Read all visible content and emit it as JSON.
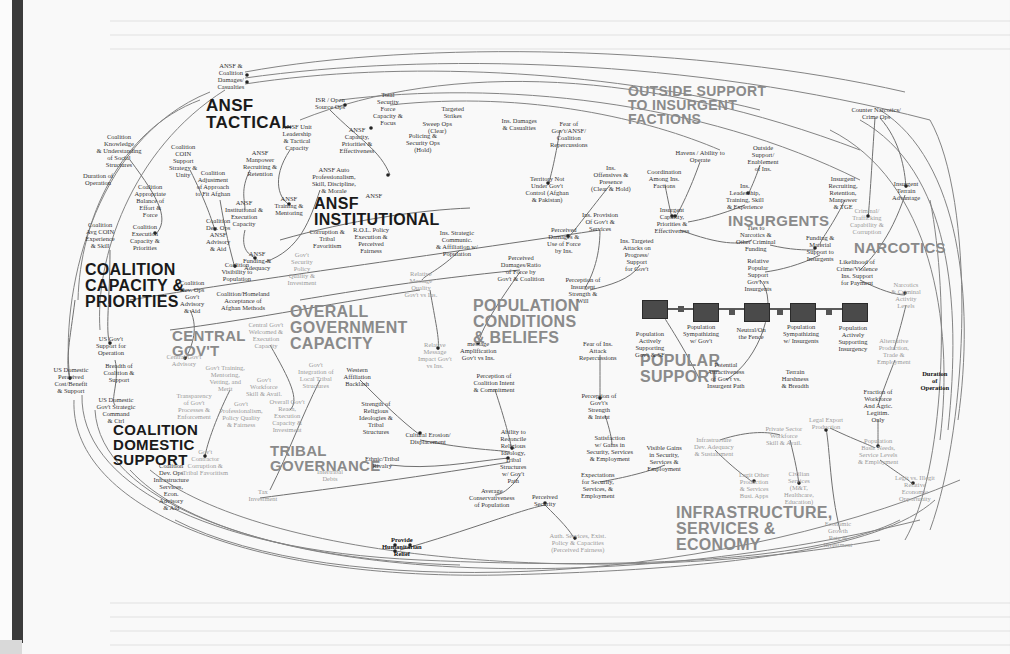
{
  "diagram": {
    "type": "causal-loop / system dynamics map",
    "clusters": [
      {
        "id": "ansf-tactical",
        "label": "ANSF\nTACTICAL",
        "x": 206,
        "y": 97,
        "size": 17,
        "tone": "dark"
      },
      {
        "id": "ansf-institutional",
        "label": "ANSF\nINSTITUTIONAL",
        "x": 314,
        "y": 196,
        "size": 16,
        "tone": "dark"
      },
      {
        "id": "coalition-capacity",
        "label": "COALITION\nCAPACITY &\nPRIORITIES",
        "x": 85,
        "y": 262,
        "size": 16,
        "tone": "dark"
      },
      {
        "id": "coalition-domestic",
        "label": "COALITION\nDOMESTIC\nSUPPORT",
        "x": 113,
        "y": 422,
        "size": 15,
        "tone": "dark"
      },
      {
        "id": "central-govt",
        "label": "CENTRAL\nGOV'T",
        "x": 172,
        "y": 328,
        "size": 15,
        "tone": "grey"
      },
      {
        "id": "overall-government",
        "label": "OVERALL\nGOVERNMENT\nCAPACITY",
        "x": 290,
        "y": 304,
        "size": 16,
        "tone": "grey"
      },
      {
        "id": "tribal-governance",
        "label": "TRIBAL\nGOVERNANCE",
        "x": 270,
        "y": 443,
        "size": 15,
        "tone": "grey"
      },
      {
        "id": "population",
        "label": "POPULATION\nCONDITIONS\n& BELIEFS",
        "x": 473,
        "y": 298,
        "size": 16,
        "tone": "grey"
      },
      {
        "id": "outside-support",
        "label": "OUTSIDE SUPPORT\nTO INSURGENT\nFACTIONS",
        "x": 628,
        "y": 84,
        "size": 14,
        "tone": "grey"
      },
      {
        "id": "insurgents",
        "label": "INSURGENTS",
        "x": 728,
        "y": 213,
        "size": 15,
        "tone": "grey"
      },
      {
        "id": "narcotics",
        "label": "NARCOTICS",
        "x": 854,
        "y": 240,
        "size": 15,
        "tone": "grey"
      },
      {
        "id": "popular-support",
        "label": "POPULAR\nSUPPORT",
        "x": 640,
        "y": 353,
        "size": 16,
        "tone": "grey"
      },
      {
        "id": "infrastructure",
        "label": "INFRASTRUCTURE,\nSERVICES &\nECONOMY",
        "x": 676,
        "y": 505,
        "size": 16,
        "tone": "grey"
      }
    ],
    "nodes": [
      {
        "label": "ANSF &\nCoalition\nDamages/\nCasualties",
        "x": 231,
        "y": 76,
        "tone": "normal"
      },
      {
        "label": "ISR / Open\nSource Ops",
        "x": 330,
        "y": 103,
        "tone": "normal"
      },
      {
        "label": "Total\nSecurity\nForce\nCapacity &\nFocus",
        "x": 388,
        "y": 108,
        "tone": "normal"
      },
      {
        "label": "Targeted\nStrikes",
        "x": 453,
        "y": 112,
        "tone": "normal"
      },
      {
        "label": "Sweep Ops\n(Clear)",
        "x": 437,
        "y": 127,
        "tone": "normal"
      },
      {
        "label": "Policing &\nSecurity Ops\n(Hold)",
        "x": 423,
        "y": 142,
        "tone": "normal"
      },
      {
        "label": "ANSF Unit\nLeadership\n& Tactical\nCapacity",
        "x": 297,
        "y": 137,
        "tone": "normal"
      },
      {
        "label": "ANSF\nCapacity,\nPriorities &\nEffectiveness",
        "x": 357,
        "y": 140,
        "tone": "normal"
      },
      {
        "label": "ANSF\nManpower\nRecruiting &\nRetention",
        "x": 260,
        "y": 163,
        "tone": "normal"
      },
      {
        "label": "ANSF Auto\nProfessionalism,\nSkill, Discipline,\n& Morale",
        "x": 334,
        "y": 180,
        "tone": "normal"
      },
      {
        "label": "ANSF\nTraining &\nMentoring",
        "x": 289,
        "y": 205,
        "tone": "normal"
      },
      {
        "label": "ANSF\nInstitutional &\nExecution\nCapacity",
        "x": 244,
        "y": 213,
        "tone": "normal"
      },
      {
        "label": "Corruption &\nTribal\nFavoritism",
        "x": 327,
        "y": 238,
        "tone": "normal"
      },
      {
        "label": "R.O.L. Policy\nExecution &\nPerceived\nFairness",
        "x": 371,
        "y": 240,
        "tone": "normal"
      },
      {
        "label": "ANSF\nFunding &\nAdequacy",
        "x": 257,
        "y": 260,
        "tone": "normal"
      },
      {
        "label": "Gov't\nSecurity\nPolicy\nQuality &\nInvestment",
        "x": 302,
        "y": 268,
        "tone": "grey"
      },
      {
        "label": "Coalition\nKnowledge\n& Understanding\nof Social\nStructures",
        "x": 119,
        "y": 150,
        "tone": "normal"
      },
      {
        "label": "Coalition\nCOIN\nSupport\nStrategy &\nUnity",
        "x": 183,
        "y": 160,
        "tone": "normal"
      },
      {
        "label": "Duration of\nOperation",
        "x": 98,
        "y": 179,
        "tone": "normal"
      },
      {
        "label": "Coalition\nAppropriate\nBalance of\nEffort &\nForce",
        "x": 150,
        "y": 200,
        "tone": "normal"
      },
      {
        "label": "Coalition\nAdjustment\nof Approach\nto Fit Afghan",
        "x": 213,
        "y": 183,
        "tone": "normal"
      },
      {
        "label": "Coalition\nAvg COIN\nExperience\n& Skill",
        "x": 100,
        "y": 235,
        "tone": "normal"
      },
      {
        "label": "Coalition\nExecution\nCapacity &\nPriorities",
        "x": 145,
        "y": 237,
        "tone": "normal"
      },
      {
        "label": "Coalition\nDev. Ops\nANSF\nAdvisory\n& Aid",
        "x": 218,
        "y": 234,
        "tone": "normal"
      },
      {
        "label": "Coalition\nVisibility to\nPopulation",
        "x": 237,
        "y": 271,
        "tone": "normal"
      },
      {
        "label": "Coalition\nDev. Ops\nGov't\nAdvisory\n& Aid",
        "x": 192,
        "y": 296,
        "tone": "normal"
      },
      {
        "label": "Coalition/Homeland\nAcceptance of\nAfghan Methods",
        "x": 243,
        "y": 300,
        "tone": "normal"
      },
      {
        "label": "US Gov't\nSupport for\nOperation",
        "x": 111,
        "y": 345,
        "tone": "normal"
      },
      {
        "label": "Breadth of\nCoalition &\nSupport",
        "x": 119,
        "y": 372,
        "tone": "normal"
      },
      {
        "label": "US Domestic\nPerceived\nCost/Benefit\n& Support",
        "x": 71,
        "y": 380,
        "tone": "normal"
      },
      {
        "label": "US Domestic\nGov't Strategic\nCommand\n& Ctrl",
        "x": 116,
        "y": 410,
        "tone": "normal"
      },
      {
        "label": "Coalition\nDev. Ops\nInfrastructure\nServices,\nEcon.\nAdvisory\n& Aid",
        "x": 171,
        "y": 486,
        "tone": "normal"
      },
      {
        "label": "Central Gov't\nAdvisory",
        "x": 184,
        "y": 360,
        "tone": "grey"
      },
      {
        "label": "Central Gov't\nWelcomed &\nExecution\nCapacity",
        "x": 266,
        "y": 335,
        "tone": "grey"
      },
      {
        "label": "Gov't Training,\nMentoring,\nVetting, and\nMerit",
        "x": 225,
        "y": 378,
        "tone": "grey"
      },
      {
        "label": "Gov't\nWorkforce\nSkill & Avail.",
        "x": 264,
        "y": 386,
        "tone": "grey"
      },
      {
        "label": "Transparency\nof Gov't\nProcesses &\nEnforcement",
        "x": 194,
        "y": 406,
        "tone": "grey"
      },
      {
        "label": "Gov't\nProfessionalism,\nPolicy Quality\n& Fairness",
        "x": 241,
        "y": 414,
        "tone": "grey"
      },
      {
        "label": "Overall Gov't\nReach,\nExecution\nCapacity &\nInvestment",
        "x": 287,
        "y": 415,
        "tone": "grey"
      },
      {
        "label": "Gov't\nIntegration of\nLocal Tribal\nStructures",
        "x": 316,
        "y": 375,
        "tone": "grey"
      },
      {
        "label": "Gov't\nContractor\nCorruption &\nTribal Favoritism",
        "x": 205,
        "y": 462,
        "tone": "grey"
      },
      {
        "label": "Tax\nInvestment",
        "x": 263,
        "y": 495,
        "tone": "grey"
      },
      {
        "label": "Western\nAffiliation\nBacklash",
        "x": 357,
        "y": 376,
        "tone": "normal"
      },
      {
        "label": "Strength of\nReligious\nIdeologies &\nTribal\nStructures",
        "x": 376,
        "y": 417,
        "tone": "normal"
      },
      {
        "label": "Cultural Erosion/\nDisplacement",
        "x": 428,
        "y": 438,
        "tone": "normal"
      },
      {
        "label": "Ethnic/Tribal\nRivalry",
        "x": 382,
        "y": 462,
        "tone": "normal"
      },
      {
        "label": "Intertribal\nDebts",
        "x": 330,
        "y": 475,
        "tone": "grey"
      },
      {
        "label": "Relative\nMessage\nQuality\nGov't vs Ins.",
        "x": 421,
        "y": 284,
        "tone": "grey"
      },
      {
        "label": "Relative\nMessage\nImpact Gov't\nvs Ins.",
        "x": 435,
        "y": 355,
        "tone": "grey"
      },
      {
        "label": "message\nAmplification\nGov't vs Ins.",
        "x": 478,
        "y": 350,
        "tone": "normal"
      },
      {
        "label": "Perception of\nCoalition Intent\n& Commitment",
        "x": 494,
        "y": 382,
        "tone": "normal"
      },
      {
        "label": "Ins. Strategic\nCommunic.\n& Affiliation w/\nPopulation",
        "x": 457,
        "y": 243,
        "tone": "normal"
      },
      {
        "label": "Perceived\nDamages/Ratio\nof Force by\nGov't & Coalition",
        "x": 521,
        "y": 268,
        "tone": "normal"
      },
      {
        "label": "Perceived\nDamages &\nUse of Force\nby Ins.",
        "x": 564,
        "y": 240,
        "tone": "normal"
      },
      {
        "label": "Perception of\nInsurgent\nStrength &\nWill",
        "x": 583,
        "y": 290,
        "tone": "normal"
      },
      {
        "label": "Ins. Provision\nOf Gov't &\nServices",
        "x": 600,
        "y": 221,
        "tone": "normal"
      },
      {
        "label": "Ins. Targeted\nAttacks on\nProgress/\nSupport\nfor Gov't",
        "x": 637,
        "y": 254,
        "tone": "normal"
      },
      {
        "label": "Ins. Damages\n& Casualties",
        "x": 519,
        "y": 124,
        "tone": "normal"
      },
      {
        "label": "Fear of\nGov't/ANSF/\nCoalition\nRepercussions",
        "x": 569,
        "y": 134,
        "tone": "normal"
      },
      {
        "label": "Territory Not\nUnder Gov't\nControl (Afghan\n& Pakistan)",
        "x": 547,
        "y": 189,
        "tone": "normal"
      },
      {
        "label": "Ins.\nOffensives &\nPresence\n(Clear & Hold)",
        "x": 611,
        "y": 178,
        "tone": "normal"
      },
      {
        "label": "Fear of Ins.\nAttack\nRepercussions",
        "x": 598,
        "y": 350,
        "tone": "normal"
      },
      {
        "label": "Perception of\nGov't's\nStrength\n& Intent",
        "x": 599,
        "y": 406,
        "tone": "normal"
      },
      {
        "label": "Ability to\nReconcile\nReligious\nIdeology,\nTribal\nStructures\nw/ Gov't\nPath",
        "x": 513,
        "y": 456,
        "tone": "normal"
      },
      {
        "label": "Average\nConservativeness\nof Population",
        "x": 492,
        "y": 497,
        "tone": "normal"
      },
      {
        "label": "Perceived\nSecurity",
        "x": 545,
        "y": 500,
        "tone": "normal"
      },
      {
        "label": "Satisfaction\nw/ Gains in\nSecurity, Services\n& Employment",
        "x": 610,
        "y": 448,
        "tone": "normal"
      },
      {
        "label": "Visible Gains\nin Security,\nServices &\nEmployment",
        "x": 664,
        "y": 458,
        "tone": "normal"
      },
      {
        "label": "Expectations\nfor Security,\nServices, &\nEmployment",
        "x": 598,
        "y": 485,
        "tone": "normal"
      },
      {
        "label": "Auth. Services, Exist.\nPolicy & Capacities\n(Perceived Fairness)",
        "x": 578,
        "y": 542,
        "tone": "grey"
      },
      {
        "label": "Provide\nHumanitarian\nRelief",
        "x": 402,
        "y": 546,
        "tone": "bold"
      },
      {
        "label": "Havens / Ability to\nOperate",
        "x": 700,
        "y": 156,
        "tone": "normal"
      },
      {
        "label": "Coordination\nAmong Ins.\nFactions",
        "x": 664,
        "y": 178,
        "tone": "normal"
      },
      {
        "label": "Outside\nSupport/\nEnablement\nof Ins.",
        "x": 763,
        "y": 158,
        "tone": "normal"
      },
      {
        "label": "Ins.\nLeadership,\nTraining, Skill\n& Experience",
        "x": 745,
        "y": 196,
        "tone": "normal"
      },
      {
        "label": "Insurgent\nCapacity,\nPriorities &\nEffectiveness",
        "x": 672,
        "y": 220,
        "tone": "normal"
      },
      {
        "label": "Insurgent\nRecruiting,\nRetention,\nManpower\n& TGE",
        "x": 843,
        "y": 192,
        "tone": "normal"
      },
      {
        "label": "Ties to\nNarcotics &\nOther Criminal\nFunding",
        "x": 756,
        "y": 238,
        "tone": "normal"
      },
      {
        "label": "Funding &\nMaterial\nSupport to\nInsurgents",
        "x": 820,
        "y": 248,
        "tone": "normal"
      },
      {
        "label": "Relative\nPopular\nSupport\nGov't vs\nInsurgents",
        "x": 758,
        "y": 274,
        "tone": "normal"
      },
      {
        "label": "Likelihood of\nCrime/Violence\nIns. Support\nfor Payment",
        "x": 857,
        "y": 272,
        "tone": "normal"
      },
      {
        "label": "Counter Narcotics/\nCrime Ops",
        "x": 876,
        "y": 113,
        "tone": "normal"
      },
      {
        "label": "Criminal/\nTrafficking\nCapability &\nCorruption",
        "x": 867,
        "y": 221,
        "tone": "grey"
      },
      {
        "label": "Insurgent\nTerrain\nAdvantage",
        "x": 906,
        "y": 190,
        "tone": "normal"
      },
      {
        "label": "Narcotics\n& Criminal\nActivity\nLevels",
        "x": 906,
        "y": 295,
        "tone": "grey"
      },
      {
        "label": "Alternative\nProduction,\nTrade &\nEmployment",
        "x": 894,
        "y": 351,
        "tone": "grey"
      },
      {
        "label": "Duration\nof\nOperation",
        "x": 935,
        "y": 380,
        "tone": "bold"
      },
      {
        "label": "Fraction of\nWorkforce\nAnd Agric.\nLegitim.\nOnly",
        "x": 878,
        "y": 405,
        "tone": "normal"
      },
      {
        "label": "Population\nActively\nSupporting\nGov't & SF",
        "x": 650,
        "y": 344,
        "tone": "normal"
      },
      {
        "label": "Population\nSympathizing\nw/ Gov't",
        "x": 701,
        "y": 333,
        "tone": "normal"
      },
      {
        "label": "Neutral/On\nthe Fence",
        "x": 751,
        "y": 333,
        "tone": "normal"
      },
      {
        "label": "Population\nSympathizing\nw/ Insurgents",
        "x": 801,
        "y": 333,
        "tone": "normal"
      },
      {
        "label": "Population\nActively\nSupporting\nInsurgency",
        "x": 853,
        "y": 338,
        "tone": "normal"
      },
      {
        "label": "Potential\nAttractiveness\nof Gov't vs.\nInsurgent Path",
        "x": 726,
        "y": 375,
        "tone": "normal"
      },
      {
        "label": "Terrain\nHarshness\n& Breadth",
        "x": 795,
        "y": 378,
        "tone": "normal"
      },
      {
        "label": "Infrastructure\nDev. Adequacy\n& Sustainment",
        "x": 714,
        "y": 446,
        "tone": "grey"
      },
      {
        "label": "Private Sector\nWorkforce\nSkill & Avail.",
        "x": 784,
        "y": 435,
        "tone": "grey"
      },
      {
        "label": "Legal Export\nProduction",
        "x": 826,
        "y": 423,
        "tone": "grey"
      },
      {
        "label": "Legit Other\nProduction\n& Services\nBusi. Apps",
        "x": 754,
        "y": 485,
        "tone": "grey"
      },
      {
        "label": "Civilian\nServices\n(M&T,\nHealthcare,\nEducation)",
        "x": 799,
        "y": 487,
        "tone": "grey"
      },
      {
        "label": "Population\nBasic Needs,\nService Levels\n& Employment",
        "x": 878,
        "y": 451,
        "tone": "grey"
      },
      {
        "label": "Legit vs. Illegit\nRelative\nEconomic\nOpportunity",
        "x": 915,
        "y": 488,
        "tone": "grey"
      },
      {
        "label": "Economic\nGrowth\nRate &\nInvestment",
        "x": 838,
        "y": 534,
        "tone": "grey"
      },
      {
        "label": "ANSF",
        "x": 374,
        "y": 195,
        "tone": "normal"
      }
    ],
    "stocks": [
      {
        "label": "Population Actively Supporting Gov't & SF",
        "x": 642,
        "y": 300
      },
      {
        "label": "Population Sympathizing w/ Gov't",
        "x": 693,
        "y": 303
      },
      {
        "label": "Neutral/On the Fence",
        "x": 744,
        "y": 303
      },
      {
        "label": "Population Sympathizing w/ Insurgents",
        "x": 790,
        "y": 303
      },
      {
        "label": "Population Actively Supporting Insurgency",
        "x": 842,
        "y": 303
      }
    ],
    "colors": {
      "background": "#f9f9f9",
      "edge": "#6b6b6b",
      "dark_label": "#1a1a1a",
      "grey_label": "#8a8a8a",
      "stock_fill": "#4a4a4a",
      "left_bar": "#3a3a3a"
    }
  }
}
